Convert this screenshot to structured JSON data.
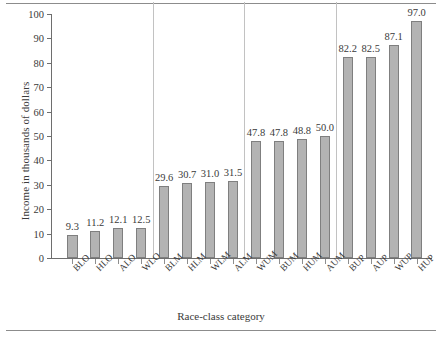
{
  "chart_data": {
    "type": "bar",
    "title": "",
    "xlabel": "Race-class category",
    "ylabel": "Income in thousands of dollars",
    "ylim": [
      0,
      100
    ],
    "ytick_step": 10,
    "grid": false,
    "legend": null,
    "yticks": [
      "0",
      "10",
      "20",
      "30",
      "40",
      "50",
      "60",
      "70",
      "80",
      "90",
      "100"
    ],
    "categories": [
      "BLO",
      "HLO",
      "ALO",
      "WLO",
      "BLM",
      "HLM",
      "WLM",
      "ALM",
      "WUM",
      "BUM",
      "HUM",
      "AUM",
      "BUP",
      "AUP",
      "WUP",
      "HUP"
    ],
    "values": [
      9.3,
      11.2,
      12.1,
      12.5,
      29.6,
      30.7,
      31.0,
      31.5,
      47.8,
      47.8,
      48.8,
      50.0,
      82.2,
      82.5,
      87.1,
      97.0
    ],
    "value_labels": [
      "9.3",
      "11.2",
      "12.1",
      "12.5",
      "29.6",
      "30.7",
      "31.0",
      "31.5",
      "47.8",
      "47.8",
      "48.8",
      "50.0",
      "82.2",
      "82.5",
      "87.1",
      "97.0"
    ],
    "group_separators_after": [
      3,
      7,
      11
    ],
    "bar_color": "#b3b3b3",
    "bar_edge_color": "#7f7f7f",
    "axis_color": "#6e6e6e",
    "separator_color": "#c2c2c2",
    "text_color": "#3a3a3a"
  }
}
